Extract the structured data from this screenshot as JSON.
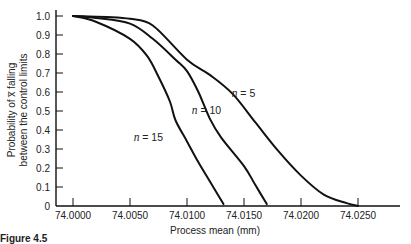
{
  "chart_data": {
    "type": "line",
    "title": "",
    "xlabel": "Process mean (mm)",
    "ylabel_line1": "Probability of x̅ falling",
    "ylabel_line2": "between the control limits",
    "xlim": [
      74.0,
      74.028
    ],
    "ylim": [
      0,
      1.0
    ],
    "grid": false,
    "x_ticks": [
      "74.0000",
      "74.0050",
      "74.0100",
      "74.0150",
      "74.0200",
      "74.0250"
    ],
    "y_ticks": [
      "0",
      "0.1",
      "0.2",
      "0.3",
      "0.4",
      "0.5",
      "0.6",
      "0.7",
      "0.8",
      "0.9",
      "1.0"
    ],
    "series": [
      {
        "name": "n = 5",
        "label_var": "n",
        "label_val": "= 5",
        "x": [
          74.0,
          74.003,
          74.005,
          74.007,
          74.01,
          74.012,
          74.014,
          74.016,
          74.018,
          74.02,
          74.022,
          74.024,
          74.025
        ],
        "y": [
          1.0,
          0.995,
          0.985,
          0.95,
          0.77,
          0.69,
          0.59,
          0.44,
          0.29,
          0.16,
          0.06,
          0.015,
          0.0
        ]
      },
      {
        "name": "n = 10",
        "label_var": "n",
        "label_val": "= 10",
        "x": [
          74.0,
          74.002,
          74.005,
          74.007,
          74.009,
          74.01,
          74.011,
          74.012,
          74.013,
          74.015,
          74.016,
          74.017
        ],
        "y": [
          1.0,
          0.99,
          0.96,
          0.88,
          0.77,
          0.71,
          0.6,
          0.46,
          0.36,
          0.21,
          0.11,
          0.01
        ]
      },
      {
        "name": "n = 15",
        "label_var": "n",
        "label_val": "= 15",
        "x": [
          74.0,
          74.002,
          74.005,
          74.0065,
          74.0075,
          74.0085,
          74.009,
          74.01,
          74.011,
          74.012,
          74.0132
        ],
        "y": [
          1.0,
          0.97,
          0.88,
          0.79,
          0.68,
          0.55,
          0.45,
          0.34,
          0.23,
          0.13,
          0.01
        ]
      }
    ],
    "annotations": [
      {
        "text": "n = 5",
        "x": 74.0141,
        "y": 0.59
      },
      {
        "text": "n = 10",
        "x": 74.0106,
        "y": 0.5
      },
      {
        "text": "n = 15",
        "x": 74.0055,
        "y": 0.36
      }
    ]
  },
  "caption": "Figure 4.5"
}
